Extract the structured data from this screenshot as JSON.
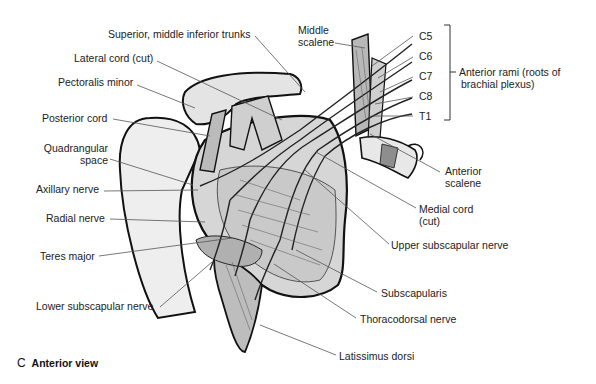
{
  "figure": {
    "caption_letter": "C",
    "caption_title": "Anterior view"
  },
  "labels": {
    "trunks": "Superior, middle inferior trunks",
    "lateral_cord": "Lateral cord (cut)",
    "pectoralis_minor": "Pectoralis minor",
    "posterior_cord": "Posterior cord",
    "quadrangular_1": "Quadrangular",
    "quadrangular_2": "space",
    "axillary_nerve": "Axillary nerve",
    "radial_nerve": "Radial nerve",
    "teres_major": "Teres  major",
    "lower_subscapular": "Lower subscapular nerve",
    "middle_scalene_1": "Middle",
    "middle_scalene_2": "scalene",
    "c5": "C5",
    "c6": "C6",
    "c7": "C7",
    "c8": "C8",
    "t1": "T1",
    "anterior_rami_1": "Anterior rami (roots of",
    "anterior_rami_2": "brachial plexus)",
    "anterior_scalene_1": "Anterior",
    "anterior_scalene_2": "scalene",
    "medial_cord_1": "Medial cord",
    "medial_cord_2": "(cut)",
    "upper_subscapular": "Upper subscapular nerve",
    "subscapularis": "Subscapularis",
    "thoracodorsal": "Thoracodorsal nerve",
    "latissimus": "Latissimus dorsi"
  },
  "colors": {
    "outline": "#111111",
    "bone": "#ececec",
    "muscle": "#c8c8c8",
    "muscle_dark": "#8e8e8e",
    "leader": "#555555"
  }
}
